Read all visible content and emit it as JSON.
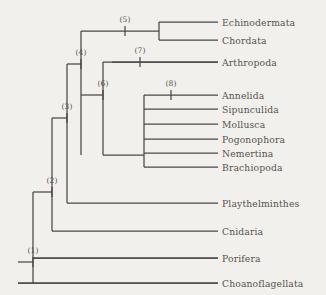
{
  "figure": {
    "name": "phylogenetic-cladogram",
    "background_color": "#f2f0ec",
    "line_color": "#4a4744",
    "text_color": "#55524e"
  },
  "taxa": [
    {
      "id": "echinodermata",
      "label": "Echinodermata",
      "y": 22,
      "branch_x_start": 159,
      "branch_x_end": 218,
      "label_x": 222
    },
    {
      "id": "chordata",
      "label": "Chordata",
      "y": 40,
      "branch_x_start": 159,
      "branch_x_end": 218,
      "label_x": 222
    },
    {
      "id": "arthropoda",
      "label": "Arthropoda",
      "y": 62,
      "branch_x_start": 112,
      "branch_x_end": 218,
      "label_x": 222
    },
    {
      "id": "annelida",
      "label": "Annelida",
      "y": 95,
      "branch_x_start": 144,
      "branch_x_end": 218,
      "label_x": 222
    },
    {
      "id": "sipunculida",
      "label": "Sipunculida",
      "y": 109,
      "branch_x_start": 144,
      "branch_x_end": 218,
      "label_x": 222
    },
    {
      "id": "mollusca",
      "label": "Mollusca",
      "y": 124,
      "branch_x_start": 144,
      "branch_x_end": 218,
      "label_x": 222
    },
    {
      "id": "pogonophora",
      "label": "Pogonophora",
      "y": 139,
      "branch_x_start": 144,
      "branch_x_end": 218,
      "label_x": 222
    },
    {
      "id": "nemertina",
      "label": "Nemertina",
      "y": 153,
      "branch_x_start": 144,
      "branch_x_end": 218,
      "label_x": 222
    },
    {
      "id": "brachiopoda",
      "label": "Brachiopoda",
      "y": 167,
      "branch_x_start": 144,
      "branch_x_end": 218,
      "label_x": 222
    },
    {
      "id": "playthelminthes",
      "label": "Playthelminthes",
      "y": 203,
      "branch_x_start": 67,
      "branch_x_end": 218,
      "label_x": 222
    },
    {
      "id": "cnidaria",
      "label": "Cnidaria",
      "y": 231,
      "branch_x_start": 52,
      "branch_x_end": 218,
      "label_x": 222
    },
    {
      "id": "porifera",
      "label": "Porifera",
      "y": 258,
      "branch_x_start": 33,
      "branch_x_end": 218,
      "label_x": 222
    },
    {
      "id": "choanoflagellata",
      "label": "Choanoflagellata",
      "y": 283,
      "branch_x_start": 18,
      "branch_x_end": 218,
      "label_x": 222
    }
  ],
  "nodes": [
    {
      "id": "node-1",
      "label": "(1)",
      "label_x": 33,
      "label_y": 250,
      "tick_x": 33,
      "tick_y": 262
    },
    {
      "id": "node-2",
      "label": "(2)",
      "label_x": 52,
      "label_y": 180,
      "tick_x": 52,
      "tick_y": 192
    },
    {
      "id": "node-3",
      "label": "(3)",
      "label_x": 67,
      "label_y": 106,
      "tick_x": 67,
      "tick_y": 118
    },
    {
      "id": "node-4",
      "label": "(4)",
      "label_x": 81,
      "label_y": 52,
      "tick_x": 81,
      "tick_y": 64
    },
    {
      "id": "node-5",
      "label": "(5)",
      "label_x": 125,
      "label_y": 19,
      "tick_x": 125,
      "tick_y": 31
    },
    {
      "id": "node-6",
      "label": "(6)",
      "label_x": 103,
      "label_y": 83,
      "tick_x": 103,
      "tick_y": 95
    },
    {
      "id": "node-7",
      "label": "(7)",
      "label_x": 140,
      "label_y": 50,
      "tick_x": 140,
      "tick_y": 62
    },
    {
      "id": "node-8",
      "label": "(8)",
      "label_x": 171,
      "label_y": 83,
      "tick_x": 171,
      "tick_y": 95
    }
  ],
  "branches": {
    "root_stub": {
      "x1": 18,
      "y1": 262,
      "x2": 33,
      "y2": 262
    },
    "node1_vertical": {
      "x1": 33,
      "y1": 192,
      "x2": 33,
      "y2": 283
    },
    "node1_to_porifera": {
      "x1": 33,
      "y1": 258,
      "x2": 218,
      "y2": 258
    },
    "choanoflagellata_line": {
      "x1": 18,
      "y1": 283,
      "x2": 218,
      "y2": 283
    },
    "node2_vertical": {
      "x1": 52,
      "y1": 118,
      "x2": 52,
      "y2": 231
    },
    "node2_stem": {
      "x1": 33,
      "y1": 192,
      "x2": 52,
      "y2": 192
    },
    "node3_vertical": {
      "x1": 67,
      "y1": 64,
      "x2": 67,
      "y2": 203
    },
    "node3_stem": {
      "x1": 52,
      "y1": 118,
      "x2": 67,
      "y2": 118
    },
    "node4_vertical": {
      "x1": 81,
      "y1": 31,
      "x2": 81,
      "y2": 155
    },
    "node4_stem": {
      "x1": 67,
      "y1": 64,
      "x2": 81,
      "y2": 64
    },
    "node5_horizontal": {
      "x1": 81,
      "y1": 31,
      "x2": 159,
      "y2": 31
    },
    "node5_vertical": {
      "x1": 159,
      "y1": 22,
      "x2": 159,
      "y2": 40
    },
    "node6_stem": {
      "x1": 81,
      "y1": 95,
      "x2": 103,
      "y2": 95
    },
    "node6_vertical": {
      "x1": 103,
      "y1": 62,
      "x2": 103,
      "y2": 155
    },
    "node7_horizontal": {
      "x1": 103,
      "y1": 62,
      "x2": 218,
      "y2": 62
    },
    "node8_stem": {
      "x1": 103,
      "y1": 155,
      "x2": 144,
      "y2": 155
    },
    "node8_vertical": {
      "x1": 144,
      "y1": 95,
      "x2": 144,
      "y2": 167
    }
  }
}
